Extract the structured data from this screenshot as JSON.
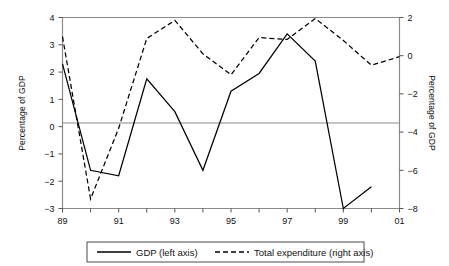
{
  "chart_data": {
    "type": "line",
    "title": "",
    "xlabel": "",
    "ylabel": "Percentage of GDP",
    "y2label": "Percentage of GDP",
    "grid": false,
    "legend_position": "bottom",
    "categories": [
      "89",
      "90",
      "91",
      "92",
      "93",
      "94",
      "95",
      "96",
      "97",
      "98",
      "99",
      "00",
      "01"
    ],
    "x_tick_labels": [
      "89",
      "",
      "91",
      "",
      "93",
      "",
      "95",
      "",
      "97",
      "",
      "99",
      "",
      "01"
    ],
    "ylim": [
      -3,
      4
    ],
    "y_ticks": [
      -3,
      -2,
      -1,
      0,
      1,
      2,
      3,
      4
    ],
    "y_tick_labels": [
      "−3",
      "−2",
      "−1",
      "0",
      "1",
      "2",
      "3",
      "4"
    ],
    "y2lim": [
      -8,
      2
    ],
    "y2_ticks": [
      -8,
      -6,
      -4,
      -2,
      0,
      2
    ],
    "y2_tick_labels": [
      "−8",
      "−6",
      "−4",
      "−2",
      "0",
      "2"
    ],
    "zero_line": 0,
    "series": [
      {
        "name": "GDP (left axis)",
        "axis": "left",
        "style": "solid",
        "color": "#000000",
        "x": [
          "89",
          "90",
          "91",
          "92",
          "93",
          "94",
          "95",
          "96",
          "97",
          "98",
          "99",
          "00"
        ],
        "values": [
          2.3,
          -1.6,
          -1.8,
          1.75,
          0.55,
          -1.6,
          1.3,
          1.95,
          3.4,
          2.4,
          -3.0,
          -2.2
        ]
      },
      {
        "name": "Total expenditure (right axis)",
        "axis": "right",
        "style": "dashed",
        "color": "#000000",
        "x": [
          "89",
          "90",
          "91",
          "92",
          "93",
          "94",
          "95",
          "96",
          "97",
          "98",
          "99",
          "00",
          "01"
        ],
        "values": [
          1.0,
          -7.5,
          -3.8,
          0.9,
          1.85,
          0.1,
          -1.0,
          0.95,
          0.85,
          1.95,
          0.8,
          -0.5,
          -0.05
        ]
      }
    ]
  },
  "axes": {
    "left_title": "Percentage of GDP",
    "right_title": "Percentage of GDP"
  },
  "legend": {
    "items": [
      {
        "label": "GDP (left axis)",
        "style": "solid"
      },
      {
        "label": "Total expenditure (right axis)",
        "style": "dashed"
      }
    ]
  }
}
